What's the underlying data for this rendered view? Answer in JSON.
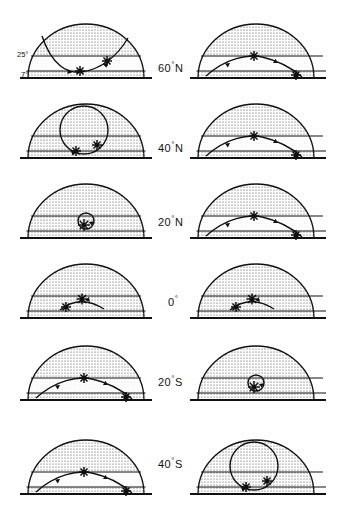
{
  "figure": {
    "colors": {
      "ink": "#111111",
      "stipple": "#4a4a4a",
      "background": "#ffffff"
    },
    "altitude_lines": [
      {
        "id": "alt-25",
        "label": "25",
        "degree": "°",
        "altitude_deg": 25
      },
      {
        "id": "alt-7",
        "label": "7",
        "degree": "°",
        "altitude_deg": 7
      }
    ],
    "columns": [
      "left",
      "right"
    ],
    "rows": [
      {
        "id": "row-60n",
        "latitude_label": "60",
        "latitude_degree": "°",
        "latitude_hemisphere": "N",
        "latitude_value": 60,
        "left": {
          "path_type": "deep-v-loop",
          "markers": 2,
          "arrows": 2
        },
        "right": {
          "path_type": "low-arc",
          "markers": 2,
          "arrows": 2
        }
      },
      {
        "id": "row-40n",
        "latitude_label": "40",
        "latitude_degree": "°",
        "latitude_hemisphere": "N",
        "latitude_value": 40,
        "left": {
          "path_type": "closed-loop",
          "markers": 2,
          "arrows": 1
        },
        "right": {
          "path_type": "low-arc",
          "markers": 2,
          "arrows": 2
        }
      },
      {
        "id": "row-20n",
        "latitude_label": "20",
        "latitude_degree": "°",
        "latitude_hemisphere": "N",
        "latitude_value": 20,
        "left": {
          "path_type": "tight-loop",
          "markers": 1,
          "arrows": 1
        },
        "right": {
          "path_type": "low-arc",
          "markers": 2,
          "arrows": 2
        }
      },
      {
        "id": "row-0",
        "latitude_label": "0",
        "latitude_degree": "°",
        "latitude_hemisphere": "",
        "latitude_value": 0,
        "left": {
          "path_type": "short-arc",
          "markers": 2,
          "arrows": 1
        },
        "right": {
          "path_type": "short-arc",
          "markers": 2,
          "arrows": 1
        }
      },
      {
        "id": "row-20s",
        "latitude_label": "20",
        "latitude_degree": "°",
        "latitude_hemisphere": "S",
        "latitude_value": -20,
        "left": {
          "path_type": "low-arc",
          "markers": 2,
          "arrows": 2
        },
        "right": {
          "path_type": "tight-loop",
          "markers": 1,
          "arrows": 1
        }
      },
      {
        "id": "row-40s",
        "latitude_label": "40",
        "latitude_degree": "°",
        "latitude_hemisphere": "S",
        "latitude_value": -40,
        "left": {
          "path_type": "low-arc",
          "markers": 2,
          "arrows": 2
        },
        "right": {
          "path_type": "closed-loop",
          "markers": 2,
          "arrows": 1
        }
      }
    ]
  }
}
